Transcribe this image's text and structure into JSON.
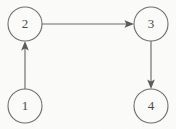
{
  "figure": {
    "kind": "directed-graph-diagram",
    "width": 176,
    "height": 129,
    "background_color": "#fbfbfa",
    "stroke_color": "#6b6b6b",
    "label_color": "#4a4a4a"
  },
  "nodes": [
    {
      "id": "1",
      "label": "1",
      "cx": 25,
      "cy": 106,
      "r": 17
    },
    {
      "id": "2",
      "label": "2",
      "cx": 25,
      "cy": 24,
      "r": 17
    },
    {
      "id": "3",
      "label": "3",
      "cx": 151,
      "cy": 24,
      "r": 17
    },
    {
      "id": "4",
      "label": "4",
      "cx": 151,
      "cy": 106,
      "r": 17
    }
  ],
  "edges": [
    {
      "id": "edge-1-2",
      "from": "1",
      "to": "2",
      "direction": "up",
      "arrowhead": "filled-triangle"
    },
    {
      "id": "edge-2-3",
      "from": "2",
      "to": "3",
      "direction": "right",
      "arrowhead": "filled-triangle"
    },
    {
      "id": "edge-3-4",
      "from": "3",
      "to": "4",
      "direction": "down",
      "arrowhead": "filled-triangle"
    }
  ]
}
